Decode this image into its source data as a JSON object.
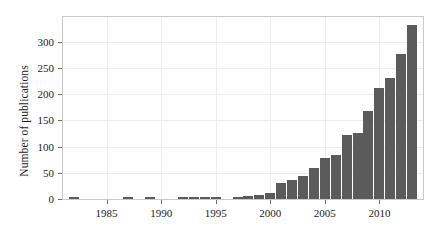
{
  "chart_data": {
    "type": "bar",
    "title": "",
    "xlabel": "",
    "ylabel": "Number of publications",
    "categories": [
      1982,
      1983,
      1984,
      1985,
      1986,
      1987,
      1988,
      1989,
      1990,
      1991,
      1992,
      1993,
      1994,
      1995,
      1996,
      1997,
      1998,
      1999,
      2000,
      2001,
      2002,
      2003,
      2004,
      2005,
      2006,
      2007,
      2008,
      2009,
      2010,
      2011,
      2012,
      2013
    ],
    "values": [
      2,
      0,
      0,
      0,
      0,
      2,
      0,
      2,
      0,
      0,
      3,
      3,
      2,
      3,
      0,
      3,
      6,
      7,
      12,
      30,
      37,
      43,
      59,
      79,
      83,
      123,
      126,
      167,
      211,
      231,
      276,
      331
    ],
    "xlim": [
      1981,
      2014
    ],
    "ylim": [
      0,
      347
    ],
    "xticks": [
      1985,
      1990,
      1995,
      2000,
      2005,
      2010
    ],
    "xtick_labels": [
      "1985",
      "1990",
      "1995",
      "2000",
      "2005",
      "2010"
    ],
    "yticks": [
      0,
      50,
      100,
      150,
      200,
      250,
      300
    ],
    "ytick_labels": [
      "0",
      "50",
      "100",
      "150",
      "200",
      "250",
      "300"
    ],
    "grid": true,
    "legend": "none",
    "bar_color": "#5b5b5b",
    "grid_color": "#ededed",
    "frame_color": "#c9c9c9",
    "text_color": "#1a1a1a",
    "background": "#ffffff"
  }
}
